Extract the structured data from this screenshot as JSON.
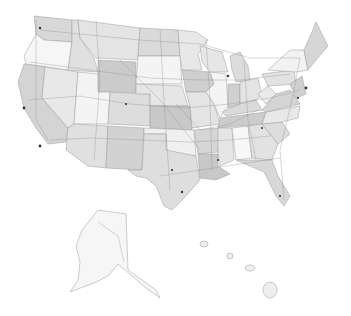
{
  "map": {
    "type": "usa-states-road-map",
    "style": "grayscale",
    "colors": {
      "background": "#ffffff",
      "light": "#f4f4f4",
      "mid": "#e2e2e2",
      "dark": "#cfcfcf",
      "hatched": "#c6c6c6",
      "border": "#9a9a9a",
      "road": "#8a8a8a",
      "city": "#333333"
    },
    "regions": [
      "contiguous-us",
      "alaska",
      "hawaii"
    ],
    "labels": []
  }
}
